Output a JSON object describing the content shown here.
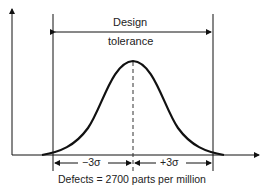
{
  "diagram": {
    "title_partial": "Process centered: ±3σ design tolerance",
    "tolerance_label_line1": "Design",
    "tolerance_label_line2": "tolerance",
    "minus_sigma_label": "−3σ",
    "plus_sigma_label": "+3σ",
    "caption": "Defects = 2700 parts per million",
    "colors": {
      "line": "#111111",
      "background": "#ffffff"
    },
    "elements": {
      "y_axis": "arrow-up",
      "x_axis": "arrow-right",
      "curve": "normal-distribution",
      "center_line": "dashed-vertical",
      "tolerance_limits": [
        "left-limit",
        "right-limit"
      ]
    }
  }
}
